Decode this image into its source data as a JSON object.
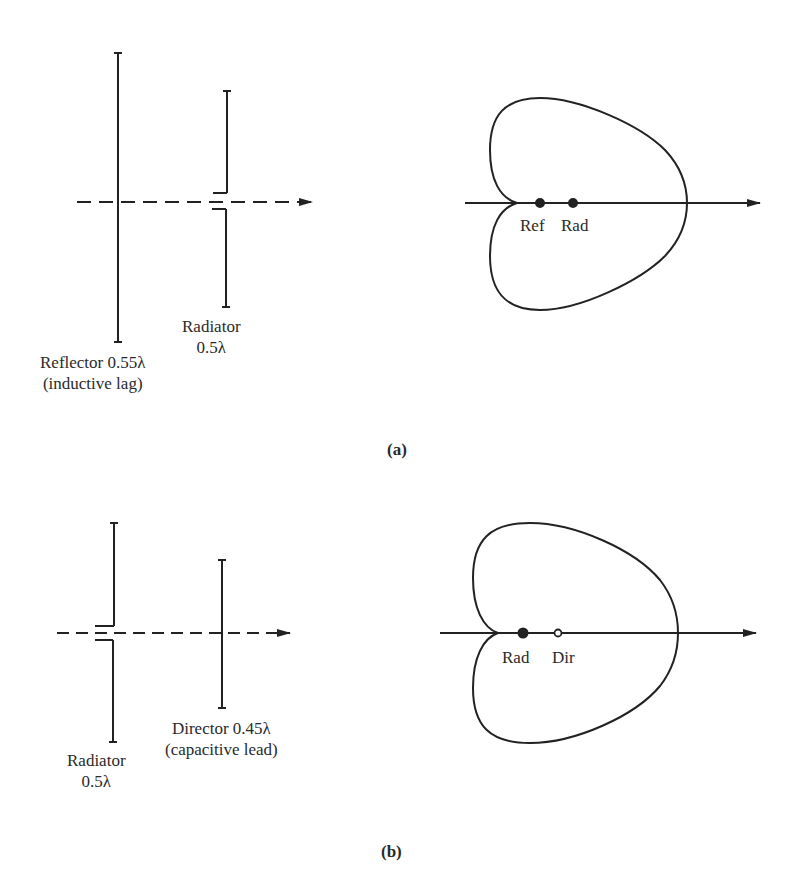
{
  "figure": {
    "part_a": {
      "caption": "(a)",
      "reflector_label_line1": "Reflector 0.55λ",
      "reflector_label_line2": "(inductive lag)",
      "radiator_label_line1": "Radiator",
      "radiator_label_line2": "0.5λ",
      "pattern_labels": [
        "Ref",
        "Rad"
      ]
    },
    "part_b": {
      "caption": "(b)",
      "radiator_label_line1": "Radiator",
      "radiator_label_line2": "0.5λ",
      "director_label_line1": "Director 0.45λ",
      "director_label_line2": "(capacitive lead)",
      "pattern_labels": [
        "Rad",
        "Dir"
      ]
    },
    "colors": {
      "ink": "#222222",
      "background": "#ffffff"
    }
  }
}
